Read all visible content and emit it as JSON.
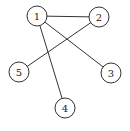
{
  "graph": {
    "node_radius": 10,
    "stroke_color": "#333333",
    "nodes": [
      {
        "id": "1",
        "label": "1",
        "x": 37,
        "y": 16
      },
      {
        "id": "2",
        "label": "2",
        "x": 99,
        "y": 17
      },
      {
        "id": "3",
        "label": "3",
        "x": 111,
        "y": 73
      },
      {
        "id": "4",
        "label": "4",
        "x": 65,
        "y": 108
      },
      {
        "id": "5",
        "label": "5",
        "x": 19,
        "y": 72
      }
    ],
    "edges": [
      {
        "from": "1",
        "to": "2"
      },
      {
        "from": "1",
        "to": "3"
      },
      {
        "from": "1",
        "to": "4"
      },
      {
        "from": "2",
        "to": "5"
      }
    ]
  }
}
